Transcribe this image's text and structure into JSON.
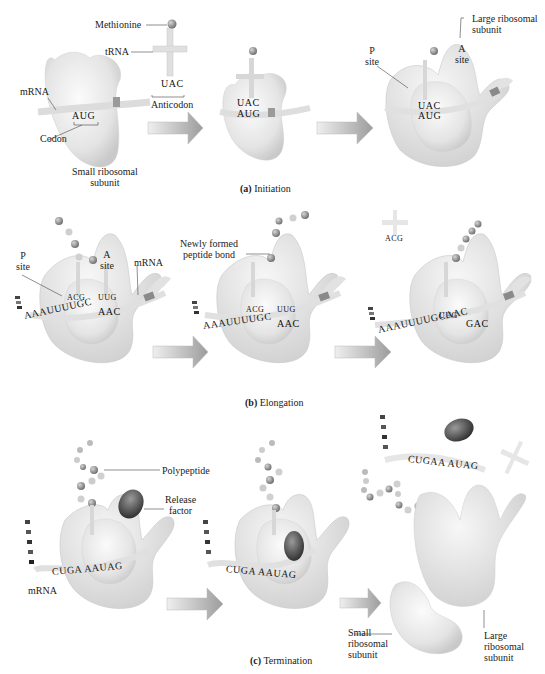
{
  "figure": {
    "panels": [
      {
        "id": "a",
        "caption_letter": "(a)",
        "caption_text": "Initiation",
        "labels": {
          "methionine": "Methionine",
          "trna": "tRNA",
          "anticodon": "Anticodon",
          "anticodon_seq": "UAC",
          "mrna": "mRNA",
          "codon": "Codon",
          "codon_seq": "AUG",
          "small_subunit_line1": "Small ribosomal",
          "small_subunit_line2": "subunit",
          "p_site_line1": "P",
          "p_site_line2": "site",
          "a_site_line1": "A",
          "a_site_line2": "site",
          "large_subunit_line1": "Large ribosomal",
          "large_subunit_line2": "subunit",
          "stage2_anticodon": "UAC",
          "stage2_codon": "AUG",
          "stage3_anticodon": "UAC",
          "stage3_codon": "AUG"
        }
      },
      {
        "id": "b",
        "caption_letter": "(b)",
        "caption_text": "Elongation",
        "labels": {
          "p_site_line1": "P",
          "p_site_line2": "site",
          "a_site_line1": "A",
          "a_site_line2": "site",
          "mrna": "mRNA",
          "peptide_bond_line1": "Newly formed",
          "peptide_bond_line2": "peptide bond",
          "stage1_mrna": "AAAUUUUGC",
          "stage1_codon2": "AAC",
          "stage1_anti1": "ACG",
          "stage1_anti2": "UUG",
          "stage2_mrna": "AAAUUUUGC",
          "stage2_codon2": "AAC",
          "stage2_anti1": "ACG",
          "stage2_anti2": "UUG",
          "stage3_mrna": "AAAUUUUGCAAC",
          "stage3_codon3": "GAC",
          "stage3_anti": "UUG",
          "stage3_released_anti": "ACG"
        }
      },
      {
        "id": "c",
        "caption_letter": "(c)",
        "caption_text": "Termination",
        "labels": {
          "polypeptide": "Polypeptide",
          "release_factor_line1": "Release",
          "release_factor_line2": "factor",
          "mrna": "mRNA",
          "stage1_mrna": "CUGA AAUAG",
          "stage2_mrna": "CUGA AAUAG",
          "stage3_mrna": "CUGAA AUAG",
          "small_subunit_line1": "Small",
          "small_subunit_line2": "ribosomal",
          "small_subunit_line3": "subunit",
          "large_subunit_line1": "Large",
          "large_subunit_line2": "ribosomal",
          "large_subunit_line3": "subunit"
        }
      }
    ],
    "colors": {
      "ribosome_light": "#f2f2f2",
      "ribosome_mid": "#d9d9d9",
      "ribosome_edge": "#bdbdbd",
      "arrow_fill": "#a8a8a8",
      "arrow_light": "#e6e6e6",
      "release_factor": "#555555",
      "amino_acid": "#9a9a9a",
      "mrna_band": "#8a8a8a"
    }
  }
}
